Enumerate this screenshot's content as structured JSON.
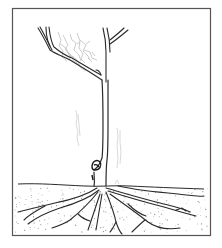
{
  "figure": {
    "kind": "line-art illustration",
    "colors": {
      "background": "#ffffff",
      "frame": "#555555",
      "ink": "#2a2a2a",
      "foliage_shading": "#b8b8b8",
      "soil_stipple": "#9a9a9a",
      "faint_marks": "#cfcfcf"
    },
    "frame": {
      "x": 12,
      "y": 8,
      "width": 199,
      "height": 228
    },
    "soil_line_y": 186,
    "caption_fragment": ""
  }
}
